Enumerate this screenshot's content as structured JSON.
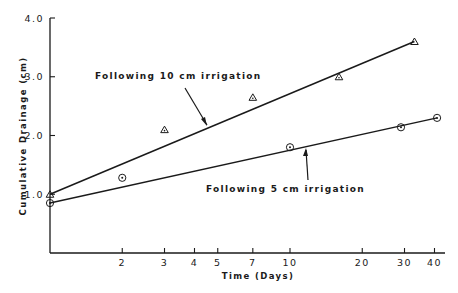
{
  "chart_data": {
    "type": "scatter",
    "title": "",
    "xlabel": "Time   (Days)",
    "ylabel": "Cumulative   Drainage   (cm)",
    "xscale": "log",
    "xlim": [
      1,
      45
    ],
    "ylim": [
      0,
      4.0
    ],
    "x_ticks": [
      2,
      3,
      4,
      5,
      7,
      10,
      20,
      30,
      40
    ],
    "x_tick_labels": [
      "2",
      "3",
      "4",
      "5",
      "7",
      "10",
      "20",
      "30",
      "40"
    ],
    "y_ticks": [
      1.0,
      2.0,
      3.0,
      4.0
    ],
    "y_tick_labels": [
      "1.0",
      "2.0",
      "3.0",
      "4.0"
    ],
    "grid": false,
    "series": [
      {
        "name": "Following 10 cm irrigation",
        "marker": "triangle",
        "x": [
          1,
          3,
          7,
          16,
          33
        ],
        "y": [
          1.0,
          2.1,
          2.65,
          3.0,
          3.6
        ],
        "fit_line": {
          "x": [
            1,
            33
          ],
          "y": [
            1.0,
            3.6
          ]
        }
      },
      {
        "name": "Following 5 cm irrigation",
        "marker": "circle-dot",
        "x": [
          1,
          2,
          10,
          29,
          41
        ],
        "y": [
          0.85,
          1.28,
          1.8,
          2.14,
          2.3
        ],
        "fit_line": {
          "x": [
            1,
            41
          ],
          "y": [
            0.85,
            2.3
          ]
        }
      }
    ],
    "annotations": [
      {
        "text": "Following 10 cm irrigation",
        "arrow_to": "10 cm fit line"
      },
      {
        "text": "Following 5 cm irrigation",
        "arrow_to": "5 cm fit line"
      }
    ]
  },
  "labels": {
    "y_axis": "Cumulative   Drainage   (cm)",
    "x_axis": "Time   (Days)",
    "annot_10": "Following 10 cm irrigation",
    "annot_5": "Following 5 cm irrigation"
  },
  "colors": {
    "ink": "#1a1a1a",
    "background": "#ffffff"
  }
}
